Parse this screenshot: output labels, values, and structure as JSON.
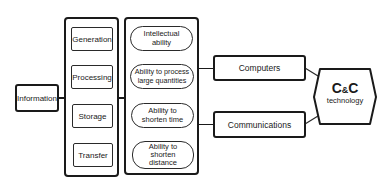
{
  "source": {
    "label": "Information"
  },
  "functions": {
    "items": [
      {
        "label": "Generation"
      },
      {
        "label": "Processing"
      },
      {
        "label": "Storage"
      },
      {
        "label": "Transfer"
      }
    ]
  },
  "abilities": {
    "items": [
      {
        "label": "Intellectual ability"
      },
      {
        "label": "Ability to process large quantities"
      },
      {
        "label": "Ability to shorten time"
      },
      {
        "label": "Ability to shorten distance"
      }
    ]
  },
  "technologies": {
    "items": [
      {
        "label": "Computers"
      },
      {
        "label": "Communications"
      }
    ]
  },
  "result": {
    "title_c1": "C",
    "title_amp": "&",
    "title_c2": "C",
    "subtitle": "technology"
  }
}
